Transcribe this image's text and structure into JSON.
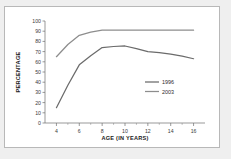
{
  "chart_data": {
    "type": "line",
    "title": "",
    "xlabel": "AGE (IN YEARS)",
    "ylabel": "PERCENTAGE",
    "xlim": [
      3,
      17
    ],
    "ylim": [
      0,
      100
    ],
    "xticks": [
      4,
      6,
      8,
      10,
      12,
      14,
      16
    ],
    "xtick_labels": [
      "4",
      "6",
      "8",
      "10",
      "12",
      "14",
      "16"
    ],
    "yticks": [
      0,
      10,
      20,
      30,
      40,
      50,
      60,
      70,
      80,
      90,
      100
    ],
    "ytick_labels": [
      "0",
      "10",
      "20",
      "30",
      "40",
      "50",
      "60",
      "70",
      "80",
      "90",
      "100"
    ],
    "grid": false,
    "legend_position": "center-right",
    "x": [
      4,
      5,
      6,
      7,
      8,
      9,
      10,
      11,
      12,
      13,
      14,
      15,
      16
    ],
    "series": [
      {
        "name": "1996",
        "color": "#6b6b6b",
        "values": [
          15,
          37,
          57,
          66,
          74,
          75,
          75.5,
          73,
          70,
          69,
          67.5,
          65.5,
          63
        ]
      },
      {
        "name": "2003",
        "color": "#8d8d8d",
        "values": [
          65,
          77,
          86,
          89,
          91,
          91,
          91,
          91,
          91,
          91,
          91,
          91,
          91
        ]
      }
    ]
  },
  "legend": {
    "entries": [
      {
        "label": "1996"
      },
      {
        "label": "2003"
      }
    ]
  },
  "colors": {
    "figure_background": "#efefef",
    "panel_background": "#ffffff",
    "panel_border": "#b8b8b8",
    "axis": "#6e6e6e",
    "series_1996": "#6b6b6b",
    "series_2003": "#8d8d8d"
  }
}
